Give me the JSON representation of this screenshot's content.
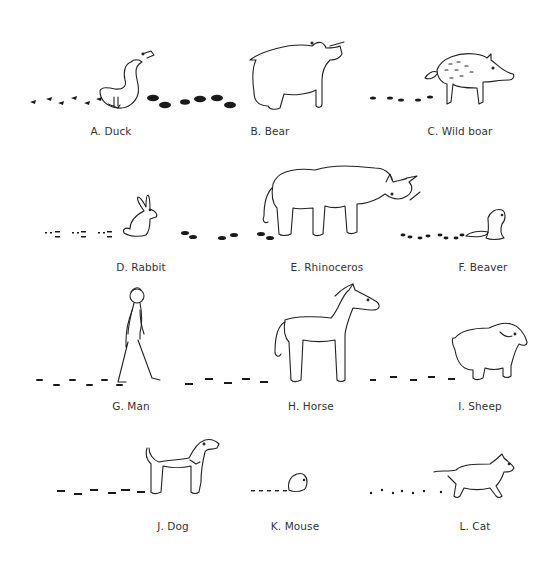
{
  "figure": {
    "panels": [
      {
        "id": "A",
        "label": "A. Duck",
        "animal": "duck",
        "track": "duck-tracks"
      },
      {
        "id": "B",
        "label": "B. Bear",
        "animal": "bear",
        "track": "bear-tracks"
      },
      {
        "id": "C",
        "label": "C. Wild boar",
        "animal": "wild-boar",
        "track": "boar-tracks"
      },
      {
        "id": "D",
        "label": "D. Rabbit",
        "animal": "rabbit",
        "track": "rabbit-tracks"
      },
      {
        "id": "E",
        "label": "E. Rhinoceros",
        "animal": "rhinoceros",
        "track": "rhino-tracks"
      },
      {
        "id": "F",
        "label": "F. Beaver",
        "animal": "beaver",
        "track": "beaver-tracks"
      },
      {
        "id": "G",
        "label": "G. Man",
        "animal": "man",
        "track": "man-tracks"
      },
      {
        "id": "H",
        "label": "H. Horse",
        "animal": "horse",
        "track": "horse-tracks"
      },
      {
        "id": "I",
        "label": "I. Sheep",
        "animal": "sheep",
        "track": "sheep-tracks"
      },
      {
        "id": "J",
        "label": "J. Dog",
        "animal": "dog",
        "track": "dog-tracks"
      },
      {
        "id": "K",
        "label": "K. Mouse",
        "animal": "mouse",
        "track": "mouse-tracks"
      },
      {
        "id": "L",
        "label": "L. Cat",
        "animal": "cat",
        "track": "cat-tracks"
      }
    ],
    "colors": {
      "ink": "#222222",
      "label": "#333333",
      "background": "#ffffff"
    }
  }
}
